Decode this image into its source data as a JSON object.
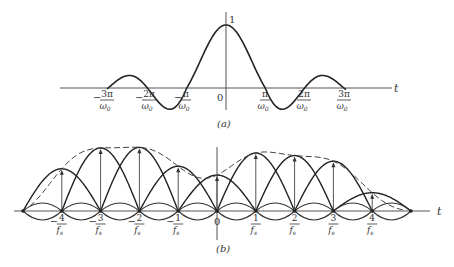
{
  "figure_a": {
    "caption": "(a)",
    "axis_label": "t",
    "peak_label": "1",
    "origin_label": "0",
    "ticks": [
      {
        "num": "3π",
        "den": "ω",
        "sub": "0",
        "neg": true
      },
      {
        "num": "2π",
        "den": "ω",
        "sub": "0",
        "neg": true
      },
      {
        "num": "π",
        "den": "ω",
        "sub": "0",
        "neg": true
      },
      {
        "num": "π",
        "den": "ω",
        "sub": "0",
        "neg": false
      },
      {
        "num": "2π",
        "den": "ω",
        "sub": "0",
        "neg": false
      },
      {
        "num": "3π",
        "den": "ω",
        "sub": "0",
        "neg": false
      }
    ],
    "curve": "sinc pulse sin(ω0 t)/(ω0 t), peak 1 at t=0, zeros at multiples of π/ω0"
  },
  "figure_b": {
    "caption": "(b)",
    "axis_label": "t",
    "origin_label": "0",
    "ticks": [
      {
        "num": "4",
        "den": "f",
        "sub": "s",
        "neg": true
      },
      {
        "num": "3",
        "den": "f",
        "sub": "s",
        "neg": true
      },
      {
        "num": "2",
        "den": "f",
        "sub": "s",
        "neg": true
      },
      {
        "num": "1",
        "den": "f",
        "sub": "s",
        "neg": true
      },
      {
        "num": "1",
        "den": "f",
        "sub": "s",
        "neg": false
      },
      {
        "num": "2",
        "den": "f",
        "sub": "s",
        "neg": false
      },
      {
        "num": "3",
        "den": "f",
        "sub": "s",
        "neg": false
      },
      {
        "num": "4",
        "den": "f",
        "sub": "s",
        "neg": false
      }
    ],
    "sample_positions": [
      "-4/fs",
      "-3/fs",
      "-2/fs",
      "-1/fs",
      "0",
      "1/fs",
      "2/fs",
      "3/fs",
      "4/fs"
    ],
    "sample_relative_heights": [
      0.67,
      1.0,
      1.01,
      0.71,
      0.57,
      0.92,
      0.88,
      0.79,
      0.29
    ],
    "envelope": "dashed reconstructed signal passing through sample tips (sum of weighted sinc pulses)"
  }
}
